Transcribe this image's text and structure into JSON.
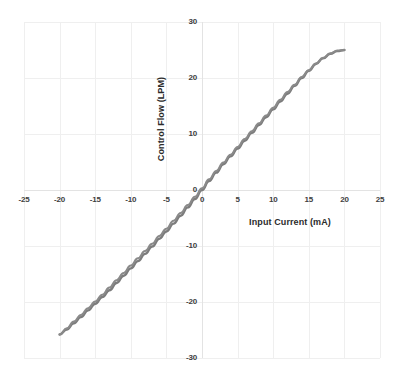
{
  "chart_data": {
    "type": "line",
    "title": "",
    "xlabel": "Input Current (mA)",
    "ylabel": "Control Flow (LPM)",
    "xlim": [
      -25,
      25
    ],
    "ylim": [
      -30,
      30
    ],
    "xticks": [
      -25,
      -20,
      -15,
      -10,
      -5,
      0,
      5,
      10,
      15,
      20,
      25
    ],
    "xtick_labels": [
      "-25",
      "-20",
      "-15",
      "-10",
      "-5",
      "0",
      "5",
      "10",
      "15",
      "20",
      "25"
    ],
    "yticks": [
      -30,
      -20,
      -10,
      0,
      10,
      20,
      30
    ],
    "ytick_labels": [
      "-30",
      "-20",
      "-10",
      "0",
      "10",
      "20",
      "30"
    ],
    "grid": true,
    "legend": "none",
    "series": [
      {
        "name": "Control Flow vs Input Current",
        "color": "#7c7c7c",
        "line_width": 2.4,
        "x": [
          -20,
          -19,
          -18,
          -17,
          -16,
          -15,
          -14,
          -13,
          -12,
          -11,
          -10,
          -9,
          -8,
          -7,
          -6,
          -5,
          -4,
          -3,
          -2,
          -1,
          0,
          1,
          2,
          3,
          4,
          5,
          6,
          7,
          8,
          9,
          10,
          11,
          12,
          13,
          14,
          15,
          16,
          17,
          18,
          19,
          20
        ],
        "y": [
          -25.8,
          -24.9,
          -23.8,
          -22.7,
          -21.5,
          -20.3,
          -19.1,
          -17.9,
          -16.6,
          -15.3,
          -14.0,
          -12.7,
          -11.4,
          -10.1,
          -8.7,
          -7.4,
          -6.0,
          -4.6,
          -3.1,
          -1.6,
          0.0,
          1.6,
          3.1,
          4.6,
          6.0,
          7.4,
          8.8,
          10.2,
          11.6,
          13.0,
          14.4,
          15.8,
          17.2,
          18.6,
          20.0,
          21.3,
          22.5,
          23.5,
          24.3,
          24.8,
          25.0
        ]
      },
      {
        "name": "Return sweep (hysteresis)",
        "color": "#8a8a8a",
        "line_width": 2.0,
        "x": [
          -20,
          -19,
          -18,
          -17,
          -16,
          -15,
          -14,
          -13,
          -12,
          -11,
          -10,
          -9,
          -8,
          -7,
          -6,
          -5,
          -4,
          -3,
          -2,
          -1,
          0,
          1,
          2,
          3,
          4,
          5,
          6,
          7,
          8,
          9,
          10,
          11,
          12,
          13,
          14,
          15,
          16,
          17,
          18,
          19,
          20
        ],
        "y": [
          -25.8,
          -24.7,
          -23.5,
          -22.3,
          -21.1,
          -19.9,
          -18.7,
          -17.4,
          -16.1,
          -14.8,
          -13.5,
          -12.2,
          -10.9,
          -9.6,
          -8.2,
          -6.9,
          -5.5,
          -4.1,
          -2.7,
          -1.2,
          0.3,
          1.9,
          3.4,
          4.9,
          6.3,
          7.7,
          9.1,
          10.5,
          11.9,
          13.3,
          14.7,
          16.1,
          17.5,
          18.8,
          20.2,
          21.4,
          22.6,
          23.6,
          24.4,
          24.9,
          25.0
        ]
      }
    ],
    "annotations": {
      "zero_crossing": "0",
      "max_flow": 25.0,
      "min_flow": -25.8,
      "curve_shape": "S-curve, near-linear mid-range with saturation at both ends"
    }
  },
  "axis": {
    "x_title": "Input Current (mA)",
    "y_title": "Control Flow (LPM)"
  },
  "caption": {
    "text": ""
  }
}
